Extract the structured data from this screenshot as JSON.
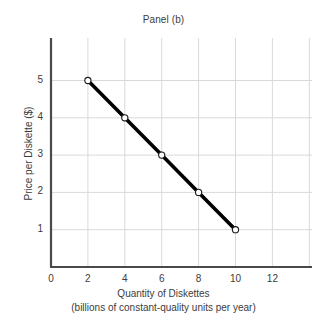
{
  "chart_data": {
    "type": "line",
    "title": "Panel (b)",
    "xlabel": "Quantity of Diskettes",
    "xlabel_line2": "(billions of constant-quality units per year)",
    "ylabel": "Price per Diskette ($)",
    "x": [
      2,
      4,
      6,
      8,
      10
    ],
    "values": [
      5,
      4,
      3,
      2,
      1
    ],
    "series": [
      {
        "name": "Demand",
        "x": [
          2,
          4,
          6,
          8,
          10
        ],
        "values": [
          5,
          4,
          3,
          2,
          1
        ]
      }
    ],
    "points": [
      {
        "x": 2,
        "y": 5
      },
      {
        "x": 4,
        "y": 4
      },
      {
        "x": 6,
        "y": 3
      },
      {
        "x": 8,
        "y": 2
      },
      {
        "x": 10,
        "y": 1
      }
    ],
    "xticks": [
      "0",
      "2",
      "4",
      "6",
      "8",
      "10",
      "12"
    ],
    "xtick_values": [
      0,
      2,
      4,
      6,
      8,
      10,
      12
    ],
    "yticks": [
      "1",
      "2",
      "3",
      "4",
      "5"
    ],
    "ytick_values": [
      1,
      2,
      3,
      4,
      5
    ],
    "origin_label": "0",
    "xlim": [
      0,
      14
    ],
    "ylim": [
      0,
      6
    ],
    "grid": true,
    "legend": "none",
    "line_color": "#000000",
    "marker_fill": "#ffffff",
    "marker_edge": "#1a1a1a",
    "grid_color": "#d9d9d9",
    "axis_color": "#4a4a4a",
    "background": "#ffffff"
  }
}
